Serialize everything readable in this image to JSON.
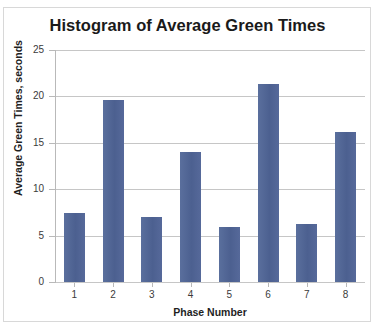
{
  "figure": {
    "top_cut_text": "",
    "border_color": "#d8d8d8",
    "background": "#ffffff"
  },
  "chart_data": {
    "type": "bar",
    "title": "Histogram of Average Green Times",
    "xlabel": "Phase Number",
    "ylabel": "Average Green Times, seconds",
    "categories": [
      "1",
      "2",
      "3",
      "4",
      "5",
      "6",
      "7",
      "8"
    ],
    "values": [
      7.4,
      19.6,
      7.0,
      14.0,
      5.9,
      21.3,
      6.3,
      16.2
    ],
    "series": [
      {
        "name": "Average Green Times",
        "values": [
          7.4,
          19.6,
          7.0,
          14.0,
          5.9,
          21.3,
          6.3,
          16.2
        ]
      }
    ],
    "ylim": [
      0,
      25
    ],
    "ytick_labels": [
      "25",
      "20",
      "15",
      "10",
      "5",
      "0"
    ],
    "ytick_values": [
      25,
      20,
      15,
      10,
      5,
      0
    ],
    "ystep": 5,
    "grid": true,
    "legend": false,
    "legend_position": "none",
    "bar_color": "#4f6593",
    "gridline_color": "#c6c6c6",
    "axis_color": "#b9b9b9",
    "title_color": "#1a1a1a",
    "tick_label_color": "#3b3b3b"
  }
}
